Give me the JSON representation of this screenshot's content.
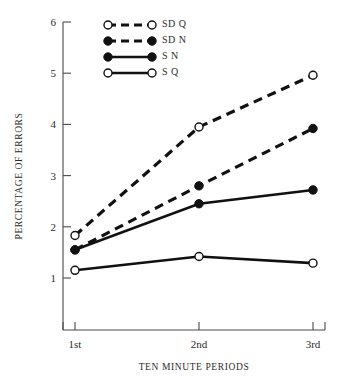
{
  "chart_data": {
    "type": "line",
    "title": "",
    "xlabel": "TEN MINUTE PERIODS",
    "ylabel": "PERCENTAGE OF ERRORS",
    "categories": [
      "1st",
      "2nd",
      "3rd"
    ],
    "ytick_labels": [
      "1",
      "2",
      "3",
      "4",
      "5",
      "6"
    ],
    "ytick_values": [
      1,
      2,
      3,
      4,
      5,
      6
    ],
    "ylim": [
      0.6,
      6
    ],
    "grid": false,
    "legend_position": "top-left",
    "series": [
      {
        "name": "SD Q",
        "values": [
          1.83,
          3.95,
          4.96
        ],
        "marker": "open-circle",
        "line_style": "dashed",
        "color": "#111111"
      },
      {
        "name": "SD N",
        "values": [
          1.55,
          2.8,
          3.92
        ],
        "marker": "filled-circle",
        "line_style": "dashed",
        "color": "#111111"
      },
      {
        "name": "S N",
        "values": [
          1.55,
          2.45,
          2.72
        ],
        "marker": "filled-circle",
        "line_style": "solid",
        "color": "#111111"
      },
      {
        "name": "S Q",
        "values": [
          1.15,
          1.42,
          1.29
        ],
        "marker": "open-circle",
        "line_style": "solid",
        "color": "#111111"
      }
    ]
  },
  "legend": {
    "entries": [
      {
        "label": "SD  Q"
      },
      {
        "label": "SD  N"
      },
      {
        "label": "S  N"
      },
      {
        "label": "S  Q"
      }
    ]
  }
}
